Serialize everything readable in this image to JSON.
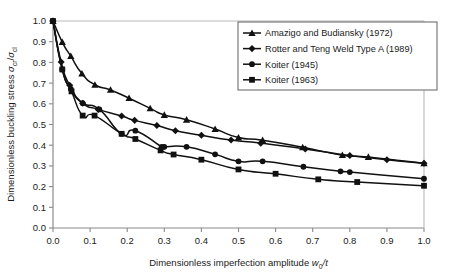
{
  "chart_data": {
    "type": "line",
    "title": "",
    "xlabel": "Dimensionless imperfection amplitude w0/t",
    "xlabel_parts": {
      "main": "Dimensionless imperfection amplitude ",
      "sym": "w",
      "sub": "0",
      "tail": "/t"
    },
    "ylabel": "Dimensionless buckling stress σcr/σcl",
    "ylabel_parts": {
      "main": "Dimensionless buckling stress ",
      "sym1": "σ",
      "sub1": "cr",
      "slash": "/",
      "sym2": "σ",
      "sub2": "cl"
    },
    "xlim": [
      0.0,
      1.0
    ],
    "ylim": [
      0.0,
      1.0
    ],
    "xticks": [
      "0.0",
      "0.1",
      "0.2",
      "0.3",
      "0.4",
      "0.5",
      "0.6",
      "0.7",
      "0.8",
      "0.9",
      "1.0"
    ],
    "xtick_values": [
      0.0,
      0.1,
      0.2,
      0.3,
      0.4,
      0.5,
      0.6,
      0.7,
      0.8,
      0.9,
      1.0
    ],
    "yticks": [
      "0.0",
      "0.1",
      "0.2",
      "0.3",
      "0.4",
      "0.5",
      "0.6",
      "0.7",
      "0.8",
      "0.9",
      "1.0"
    ],
    "ytick_values": [
      0.0,
      0.1,
      0.2,
      0.3,
      0.4,
      0.5,
      0.6,
      0.7,
      0.8,
      0.9,
      1.0
    ],
    "grid": false,
    "legend_position": "top-right",
    "line_color": "#111111",
    "series": [
      {
        "name": "Amazigo and Budiansky (1972)",
        "marker": "triangle",
        "color": "#111111",
        "points": [
          [
            0.0,
            1.0
          ],
          [
            0.025,
            0.898
          ],
          [
            0.048,
            0.83
          ],
          [
            0.078,
            0.746
          ],
          [
            0.113,
            0.692
          ],
          [
            0.155,
            0.667
          ],
          [
            0.205,
            0.627
          ],
          [
            0.262,
            0.578
          ],
          [
            0.3,
            0.546
          ],
          [
            0.36,
            0.523
          ],
          [
            0.437,
            0.478
          ],
          [
            0.5,
            0.437
          ],
          [
            0.565,
            0.424
          ],
          [
            0.673,
            0.39
          ],
          [
            0.78,
            0.352
          ],
          [
            0.85,
            0.343
          ],
          [
            1.0,
            0.312
          ]
        ]
      },
      {
        "name": "Rotter and Teng Weld Type A (1989)",
        "marker": "diamond",
        "color": "#111111",
        "points": [
          [
            0.0,
            1.0
          ],
          [
            0.022,
            0.802
          ],
          [
            0.045,
            0.69
          ],
          [
            0.08,
            0.603
          ],
          [
            0.122,
            0.573
          ],
          [
            0.185,
            0.541
          ],
          [
            0.22,
            0.52
          ],
          [
            0.28,
            0.495
          ],
          [
            0.33,
            0.47
          ],
          [
            0.4,
            0.448
          ],
          [
            0.48,
            0.425
          ],
          [
            0.56,
            0.41
          ],
          [
            0.68,
            0.382
          ],
          [
            0.8,
            0.35
          ],
          [
            0.9,
            0.33
          ],
          [
            1.0,
            0.313
          ]
        ]
      },
      {
        "name": "Koiter (1945)",
        "marker": "circle",
        "color": "#111111",
        "points": [
          [
            0.0,
            1.0
          ],
          [
            0.025,
            0.766
          ],
          [
            0.048,
            0.672
          ],
          [
            0.08,
            0.603
          ],
          [
            0.125,
            0.573
          ],
          [
            0.185,
            0.455
          ],
          [
            0.222,
            0.47
          ],
          [
            0.293,
            0.392
          ],
          [
            0.3,
            0.392
          ],
          [
            0.36,
            0.392
          ],
          [
            0.437,
            0.356
          ],
          [
            0.5,
            0.322
          ],
          [
            0.565,
            0.322
          ],
          [
            0.675,
            0.296
          ],
          [
            0.775,
            0.274
          ],
          [
            0.8,
            0.27
          ],
          [
            1.0,
            0.238
          ]
        ]
      },
      {
        "name": "Koiter (1963)",
        "marker": "square",
        "color": "#111111",
        "points": [
          [
            0.0,
            1.0
          ],
          [
            0.025,
            0.766
          ],
          [
            0.05,
            0.66
          ],
          [
            0.08,
            0.543
          ],
          [
            0.112,
            0.543
          ],
          [
            0.185,
            0.455
          ],
          [
            0.222,
            0.43
          ],
          [
            0.29,
            0.375
          ],
          [
            0.325,
            0.355
          ],
          [
            0.4,
            0.33
          ],
          [
            0.5,
            0.283
          ],
          [
            0.6,
            0.262
          ],
          [
            0.715,
            0.235
          ],
          [
            0.82,
            0.222
          ],
          [
            1.0,
            0.204
          ]
        ]
      }
    ]
  },
  "legend": {
    "items": [
      {
        "label": "Amazigo and Budiansky (1972)",
        "marker": "triangle"
      },
      {
        "label": "Rotter and Teng Weld Type A (1989)",
        "marker": "diamond"
      },
      {
        "label": "Koiter (1945)",
        "marker": "circle"
      },
      {
        "label": "Koiter (1963)",
        "marker": "square"
      }
    ]
  },
  "colors": {
    "line": "#111111",
    "frame": "#8a8a8a",
    "text": "#1a1a1a",
    "background": "#ffffff"
  }
}
